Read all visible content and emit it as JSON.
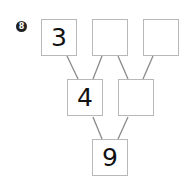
{
  "problem": {
    "number": "8",
    "badge_color": "#222222"
  },
  "tree": {
    "top": [
      {
        "value": "3"
      },
      {
        "value": ""
      },
      {
        "value": ""
      }
    ],
    "middle": [
      {
        "value": "4"
      },
      {
        "value": ""
      }
    ],
    "bottom": {
      "value": "9"
    }
  },
  "colors": {
    "line": "#8a8a8a",
    "box_border": "#b8b8b8"
  }
}
